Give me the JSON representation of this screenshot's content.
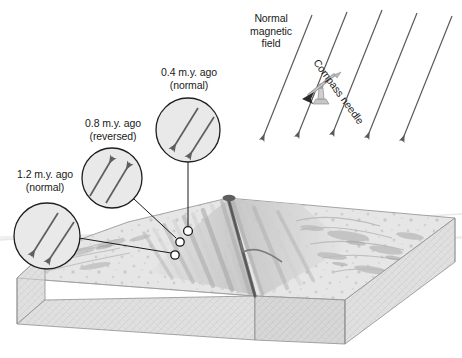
{
  "figure": {
    "width": 462,
    "height": 358
  },
  "annotations": {
    "age_12": {
      "age_line": "1.2 m.y. ago",
      "polarity_line": "(normal)",
      "polarity": "normal",
      "arrow_direction": "down-left"
    },
    "age_08": {
      "age_line": "0.8 m.y. ago",
      "polarity_line": "(reversed)",
      "polarity": "reversed",
      "arrow_direction": "up-right"
    },
    "age_04": {
      "age_line": "0.4 m.y. ago",
      "polarity_line": "(normal)",
      "polarity": "normal",
      "arrow_direction": "down-left"
    }
  },
  "field": {
    "line1": "Normal",
    "line2": "magnetic",
    "line3": "field",
    "compass_label": "Compass needle",
    "line_count": 5,
    "direction": "down-left"
  },
  "colors": {
    "ink": "#1a1a1a",
    "stroke": "#3a3a3a",
    "circle_fill": "#e8e8e8",
    "arrow": "#555555",
    "block_top": "#e2e2e2",
    "block_side": "#d2d2d2",
    "block_front": "#dcdcdc",
    "ridge_dark": "#8d8d8d",
    "stripe_light": "#d8d8d8",
    "stripe_dark": "#b4b4b4",
    "field_line": "#5a5a5a"
  }
}
